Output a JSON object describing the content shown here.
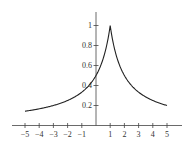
{
  "chart_data": {
    "type": "line",
    "title": "",
    "xlabel": "",
    "ylabel": "",
    "function": "f(x) = 1 / (1 + |x - 1|)",
    "x_ticks": [
      -5,
      -4,
      -3,
      -2,
      -1,
      1,
      2,
      3,
      4,
      5
    ],
    "x_tick_labels": [
      "−5",
      "−4",
      "−3",
      "−2",
      "−1",
      "1",
      "2",
      "3",
      "4",
      "5"
    ],
    "y_ticks": [
      0.2,
      0.4,
      0.6,
      0.8,
      1
    ],
    "y_tick_labels": [
      "0.2",
      "0.4",
      "0.6",
      "0.8",
      "1"
    ],
    "xlim": [
      -5.5,
      5.5
    ],
    "ylim": [
      0,
      1.1
    ],
    "grid": false,
    "legend": null,
    "series": [
      {
        "name": "f(x)",
        "x": [
          -5,
          -4,
          -3,
          -2,
          -1,
          0,
          0.5,
          1,
          1.5,
          2,
          3,
          4,
          5
        ],
        "values": [
          0.143,
          0.167,
          0.2,
          0.25,
          0.333,
          0.5,
          0.667,
          1.0,
          0.667,
          0.5,
          0.333,
          0.25,
          0.2
        ]
      }
    ],
    "color": "#222222"
  }
}
